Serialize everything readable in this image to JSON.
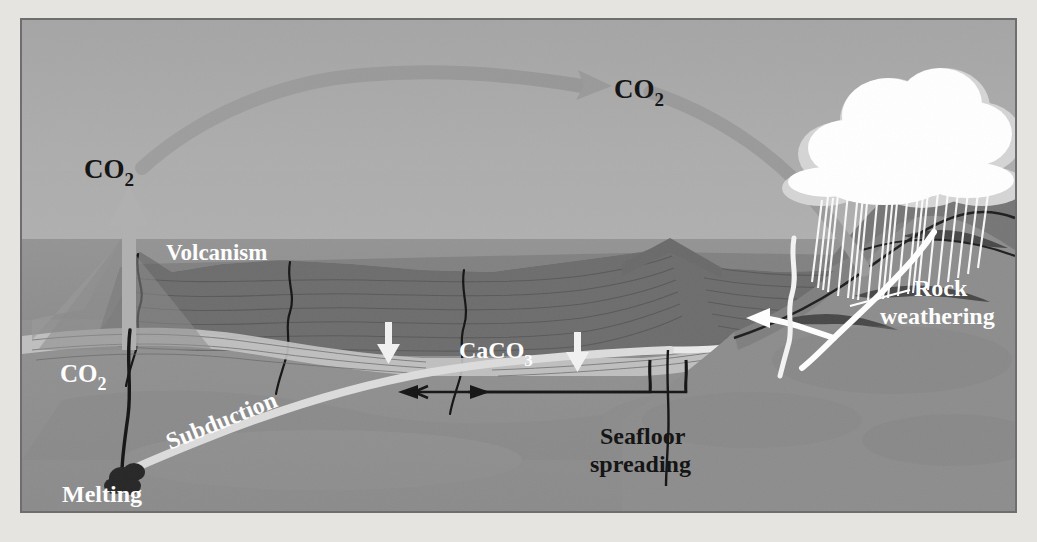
{
  "figure": {
    "domain": "diagram",
    "background_color": "#e6e4e0",
    "panel_border_color": "#6e6e6e"
  },
  "palette": {
    "sky": "#a8a8a8",
    "sky_haze": "#b4b4b4",
    "ocean": "#8d8d8d",
    "ocean_deep": "#8a8a8a",
    "mantle": "#8f8f8f",
    "mantle_dark": "#868686",
    "crust_dark": "#6d6d6d",
    "crust_mid": "#7a7a7a",
    "crust_light": "#b9b9b9",
    "slab_band": "#d8d8d8",
    "carbonate_band": "#e4e4e4",
    "arc_arrow": "#9a9a9a",
    "co2_arrow_up": "#b0b0b0",
    "cloud": "#ffffff",
    "cloud_shadow": "#d9d9d9",
    "rain": "#ffffff",
    "river": "#ffffff",
    "label_dark": "#111111",
    "label_light": "#ffffff",
    "magma": "#2a2a2a"
  },
  "labels": {
    "co2_atmospheric": {
      "text": "CO",
      "sub": "2",
      "color": "#111111",
      "description": "atmospheric CO2 at apex of transport arc"
    },
    "co2_volcanic": {
      "text": "CO",
      "sub": "2",
      "color": "#111111",
      "description": "CO2 released upward from volcanic arc"
    },
    "co2_subduction": {
      "text": "CO",
      "sub": "2",
      "color": "#ffffff",
      "description": "CO2 rising from melting slab through conduit"
    },
    "volcanism": {
      "text": "Volcanism",
      "color": "#ffffff"
    },
    "caco3": {
      "text": "CaCO",
      "sub": "3",
      "color": "#ffffff",
      "description": "carbonate sediment deposition on seafloor"
    },
    "subduction": {
      "text": "Subduction",
      "color": "#ffffff",
      "rotation_deg": -22
    },
    "melting": {
      "text": "Melting",
      "color": "#ffffff"
    },
    "seafloor_spreading": {
      "line1": "Seafloor",
      "line2": "spreading",
      "color": "#111111"
    },
    "rock_weathering": {
      "line1": "Rock",
      "line2": "weathering",
      "color": "#ffffff"
    }
  },
  "arrows": {
    "atmospheric_arc": {
      "name": "co2-transport-arc",
      "direction": "left-to-right, arching over ocean",
      "color": "#9a9a9a"
    },
    "volcanic_up": {
      "name": "co2-up-arrow",
      "direction": "up",
      "color": "#b0b0b0"
    },
    "caco3_down": {
      "name": "caco3-settling-arrow",
      "direction": "down",
      "color": "#ffffff"
    },
    "ridge_down": {
      "name": "ridge-settling-arrow",
      "direction": "down",
      "color": "#ffffff"
    },
    "spreading_left": {
      "name": "spreading-arrow-left",
      "direction": "left",
      "color": "#111111"
    },
    "spreading_right": {
      "name": "spreading-arrow-right",
      "direction": "right",
      "color": "#111111"
    },
    "runoff": {
      "name": "river-runoff-arrow",
      "direction": "down-left into ocean",
      "color": "#ffffff"
    }
  },
  "features": {
    "cloud": {
      "name": "rain-cloud",
      "color": "#ffffff"
    },
    "rain": {
      "name": "rain-streaks",
      "count": 22,
      "color": "#ffffff"
    },
    "ocean_surface_y": 237,
    "volcano_cone": {
      "name": "volcanic-arc-cone"
    },
    "mid_ocean_ridge": {
      "name": "mid-ocean-ridge"
    },
    "magma_blob": {
      "name": "melting-magma-blob",
      "color": "#2a2a2a"
    }
  }
}
